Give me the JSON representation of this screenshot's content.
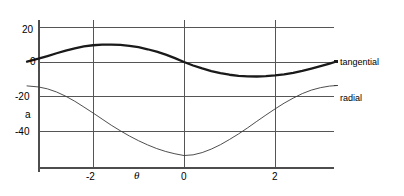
{
  "chart_data": {
    "type": "line",
    "title": "",
    "xlabel": "θ",
    "ylabel": "a",
    "xlim": [
      -3.45,
      3.35
    ],
    "ylim": [
      -60,
      24
    ],
    "grid": true,
    "grid_style": "full-frame gridlines at each tick",
    "legend_position": "right-of-axes, at curve end",
    "xticks": [
      -2,
      0,
      2
    ],
    "xtick_labels": [
      "-2",
      "0",
      "2"
    ],
    "yticks": [
      20,
      0,
      -20,
      -40
    ],
    "ytick_labels": [
      "20",
      "0",
      "-20",
      "-40"
    ],
    "series": [
      {
        "name": "tangential",
        "label": "tangential",
        "color": "#1a1a1a",
        "linewidth": 2.3,
        "x": [
          -3.45,
          -3.2,
          -3.0,
          -2.8,
          -2.6,
          -2.4,
          -2.2,
          -2.0,
          -1.8,
          -1.6,
          -1.4,
          -1.2,
          -1.0,
          -0.8,
          -0.6,
          -0.4,
          -0.2,
          0.0,
          0.2,
          0.4,
          0.6,
          0.8,
          1.0,
          1.2,
          1.4,
          1.6,
          1.8,
          2.0,
          2.2,
          2.4,
          2.6,
          2.8,
          3.0,
          3.2,
          3.35
        ],
        "y": [
          0.2,
          1.9,
          3.4,
          5.0,
          6.5,
          7.8,
          8.9,
          9.6,
          10.0,
          10.0,
          9.8,
          9.3,
          8.5,
          7.3,
          5.9,
          4.2,
          2.2,
          0.0,
          -2.0,
          -3.7,
          -5.2,
          -6.4,
          -7.3,
          -7.9,
          -8.2,
          -8.3,
          -8.1,
          -7.7,
          -7.1,
          -6.2,
          -5.1,
          -3.8,
          -2.4,
          -0.9,
          0.3
        ]
      },
      {
        "name": "radial",
        "label": "radial",
        "color": "#3a3a3a",
        "linewidth": 0.9,
        "x": [
          -3.45,
          -3.2,
          -3.0,
          -2.8,
          -2.6,
          -2.4,
          -2.2,
          -2.0,
          -1.8,
          -1.6,
          -1.4,
          -1.2,
          -1.0,
          -0.8,
          -0.6,
          -0.4,
          -0.2,
          0.0,
          0.2,
          0.4,
          0.6,
          0.8,
          1.0,
          1.2,
          1.4,
          1.6,
          1.8,
          2.0,
          2.2,
          2.4,
          2.6,
          2.8,
          3.0,
          3.2,
          3.35
        ],
        "y": [
          -13.7,
          -14.3,
          -15.4,
          -17.2,
          -19.6,
          -22.5,
          -25.8,
          -29.2,
          -32.7,
          -36.2,
          -39.4,
          -42.4,
          -45.1,
          -47.5,
          -49.6,
          -51.3,
          -52.6,
          -53.6,
          -53.2,
          -51.9,
          -49.9,
          -47.4,
          -44.4,
          -41.2,
          -37.7,
          -34.0,
          -30.4,
          -26.9,
          -23.6,
          -20.7,
          -18.1,
          -16.1,
          -14.7,
          -13.8,
          -13.5
        ]
      }
    ]
  },
  "labels": {
    "ytick_20": "20",
    "ytick_0": "0",
    "ytick_neg20": "-20",
    "ytick_neg40": "-40",
    "xtick_neg2": "-2",
    "xtick_0": "0",
    "xtick_2": "2",
    "y_axis_title": "a",
    "x_axis_title": "θ",
    "legend_tangential": "tangential",
    "legend_radial": "radial"
  },
  "colors": {
    "background": "#ffffff",
    "axis": "#4d4d4d",
    "gridline": "#555555",
    "tangential_curve": "#1a1a1a",
    "radial_curve": "#3a3a3a",
    "text": "#000000"
  }
}
